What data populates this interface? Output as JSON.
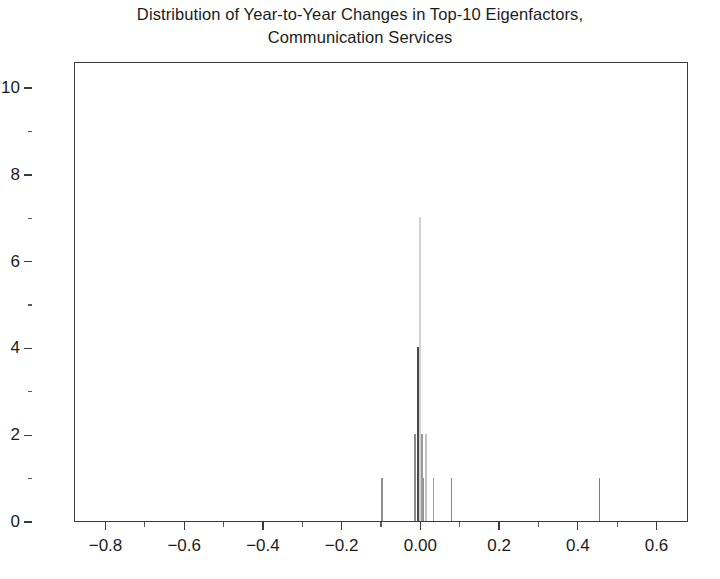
{
  "chart_data": {
    "type": "bar",
    "title": "Distribution of Year-to-Year Changes in Top-10 Eigenfactors,\nCommunication Services",
    "title_line_1": "Distribution of Year-to-Year Changes in Top-10 Eigenfactors,",
    "title_line_2": "Communication Services",
    "xlabel": "",
    "ylabel": "",
    "xlim": [
      -0.88,
      0.68
    ],
    "ylim": [
      0,
      10.6
    ],
    "grid": false,
    "legend": null,
    "bar_color": "#555555",
    "frame_color": "#3a3a3a",
    "x_ticks": [
      -0.8,
      -0.6,
      -0.4,
      -0.2,
      0.0,
      0.2,
      0.4,
      0.6
    ],
    "x_tick_labels": [
      "−0.8",
      "−0.6",
      "−0.4",
      "−0.2",
      "0.00",
      "0.2",
      "0.4",
      "0.6"
    ],
    "x_minor_ticks": [
      -0.7,
      -0.5,
      -0.3,
      -0.1,
      0.1,
      0.3,
      0.5
    ],
    "y_ticks": [
      0,
      2,
      4,
      6,
      8,
      10
    ],
    "y_tick_labels": [
      "0",
      "2",
      "4",
      "6",
      "8",
      "10"
    ],
    "y_minor_ticks": [
      1,
      3,
      5,
      7,
      9
    ],
    "x": [
      -0.1,
      -0.016,
      -0.008,
      -0.003,
      0.002,
      0.006,
      0.012,
      0.03,
      0.076,
      0.452
    ],
    "values": [
      1,
      2,
      4,
      7,
      2,
      1,
      1,
      1,
      1,
      1
    ],
    "bars": [
      {
        "x": -0.1,
        "height": 1,
        "shade": "#8d8d8d",
        "width": 1.3
      },
      {
        "x": -0.016,
        "height": 2,
        "shade": "#8a8a8a",
        "width": 1.5
      },
      {
        "x": -0.008,
        "height": 4,
        "shade": "#4a4a4a",
        "width": 2.2
      },
      {
        "x": -0.003,
        "height": 7,
        "shade": "#d2d2d2",
        "width": 1.4
      },
      {
        "x": 0.002,
        "height": 2,
        "shade": "#9a9a9a",
        "width": 1.6
      },
      {
        "x": 0.006,
        "height": 1,
        "shade": "#8f8f8f",
        "width": 1.5
      },
      {
        "x": 0.012,
        "height": 2,
        "shade": "#c2c2c2",
        "width": 1.3
      },
      {
        "x": 0.03,
        "height": 1,
        "shade": "#9c9c9c",
        "width": 1.3
      },
      {
        "x": 0.076,
        "height": 1,
        "shade": "#8a8a8a",
        "width": 1.3
      },
      {
        "x": 0.452,
        "height": 1,
        "shade": "#7c7c7c",
        "width": 1.3
      }
    ]
  }
}
